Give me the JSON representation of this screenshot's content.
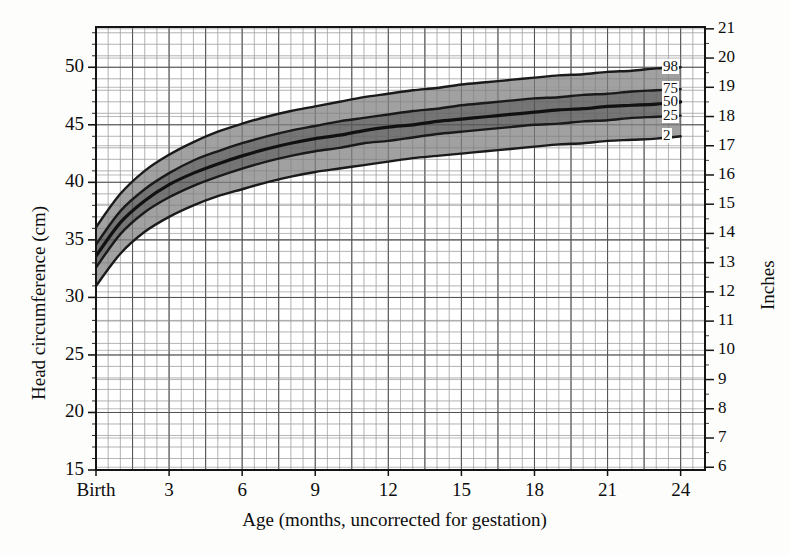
{
  "chart_data": {
    "type": "line",
    "title": "",
    "xlabel": "Age (months, uncorrected for gestation)",
    "ylabel": "Head circumference (cm)",
    "y2label": "Inches",
    "xlim": [
      0,
      25
    ],
    "ylim": [
      15,
      53.5
    ],
    "y2lim": [
      6,
      21.1
    ],
    "grid": true,
    "legend_position": "right-inside",
    "x_tick_labels": [
      "Birth",
      "3",
      "6",
      "9",
      "12",
      "15",
      "18",
      "21",
      "24"
    ],
    "x_tick_values": [
      0,
      3,
      6,
      9,
      12,
      15,
      18,
      21,
      24
    ],
    "y_tick_labels": [
      "15",
      "20",
      "25",
      "30",
      "35",
      "40",
      "45",
      "50"
    ],
    "y_tick_values": [
      15,
      20,
      25,
      30,
      35,
      40,
      45,
      50
    ],
    "y2_tick_labels": [
      "6",
      "7",
      "8",
      "9",
      "10",
      "11",
      "12",
      "13",
      "14",
      "15",
      "16",
      "17",
      "18",
      "19",
      "20",
      "21"
    ],
    "y2_tick_values": [
      6,
      7,
      8,
      9,
      10,
      11,
      12,
      13,
      14,
      15,
      16,
      17,
      18,
      19,
      20,
      21
    ],
    "x": [
      0,
      1,
      2,
      3,
      4,
      5,
      6,
      7,
      8,
      9,
      10,
      11,
      12,
      13,
      14,
      15,
      16,
      17,
      18,
      19,
      20,
      21,
      22,
      23,
      24
    ],
    "series": [
      {
        "name": "98",
        "label": "98",
        "color": "#1a1a1a",
        "values": [
          36.1,
          39.0,
          41.0,
          42.4,
          43.5,
          44.4,
          45.1,
          45.7,
          46.2,
          46.6,
          47.0,
          47.4,
          47.7,
          48.0,
          48.2,
          48.5,
          48.7,
          48.9,
          49.1,
          49.3,
          49.4,
          49.6,
          49.7,
          49.9,
          50.0
        ]
      },
      {
        "name": "75",
        "label": "75",
        "color": "#1a1a1a",
        "values": [
          34.6,
          37.5,
          39.4,
          40.8,
          41.9,
          42.7,
          43.4,
          44.0,
          44.5,
          44.9,
          45.3,
          45.6,
          45.9,
          46.2,
          46.4,
          46.7,
          46.9,
          47.1,
          47.3,
          47.4,
          47.6,
          47.7,
          47.9,
          48.0,
          48.1
        ]
      },
      {
        "name": "50",
        "label": "50",
        "color": "#111111",
        "values": [
          33.6,
          36.5,
          38.4,
          39.8,
          40.8,
          41.6,
          42.3,
          42.9,
          43.4,
          43.8,
          44.1,
          44.5,
          44.8,
          45.0,
          45.3,
          45.5,
          45.7,
          45.9,
          46.1,
          46.3,
          46.4,
          46.6,
          46.7,
          46.8,
          47.0
        ]
      },
      {
        "name": "25",
        "label": "25",
        "color": "#1a1a1a",
        "values": [
          32.6,
          35.5,
          37.4,
          38.7,
          39.7,
          40.5,
          41.2,
          41.8,
          42.3,
          42.7,
          43.0,
          43.4,
          43.6,
          43.9,
          44.2,
          44.4,
          44.6,
          44.8,
          45.0,
          45.1,
          45.3,
          45.4,
          45.6,
          45.7,
          45.8
        ]
      },
      {
        "name": "2",
        "label": "2",
        "color": "#1a1a1a",
        "values": [
          31.0,
          33.8,
          35.7,
          37.0,
          38.0,
          38.8,
          39.4,
          40.0,
          40.5,
          40.9,
          41.2,
          41.5,
          41.8,
          42.1,
          42.3,
          42.5,
          42.7,
          42.9,
          43.1,
          43.3,
          43.4,
          43.6,
          43.7,
          43.8,
          44.0
        ]
      }
    ],
    "bands": [
      {
        "name": "band-2-25",
        "lower": "2",
        "upper": "25",
        "fill": "#9c9c9c"
      },
      {
        "name": "band-25-50",
        "lower": "25",
        "upper": "50",
        "fill": "#6e6e6e"
      },
      {
        "name": "band-50-75",
        "lower": "50",
        "upper": "75",
        "fill": "#6e6e6e"
      },
      {
        "name": "band-75-98",
        "lower": "75",
        "upper": "98",
        "fill": "#9c9c9c"
      }
    ],
    "colors": {
      "grid_major": "#6b6b6b",
      "grid_minor": "#c9c9c9",
      "axis": "#141414",
      "band_outer": "#9c9c9c",
      "band_inner": "#6e6e6e",
      "curve": "#141414",
      "background": "#fdfdfc"
    }
  }
}
